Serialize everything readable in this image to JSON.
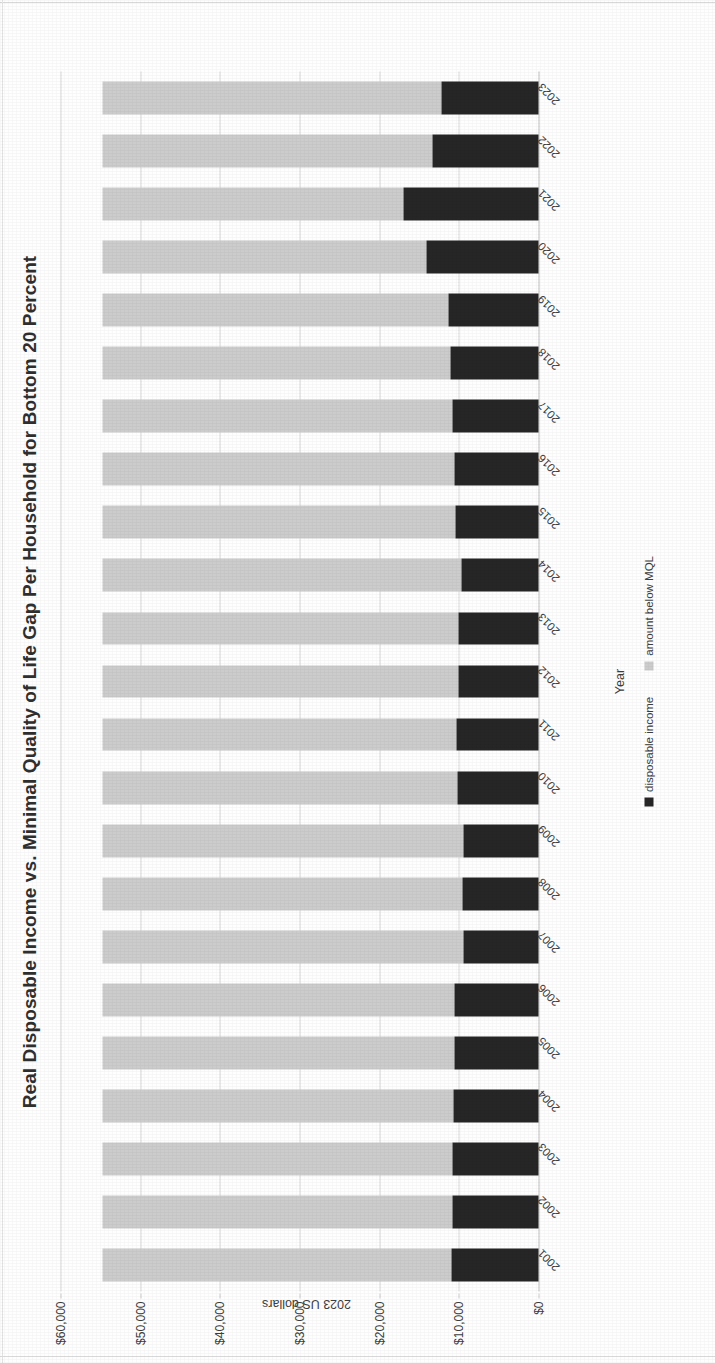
{
  "chart_data": {
    "type": "bar",
    "subtype": "stacked-horizontal-scan",
    "title": "Real Disposable Income vs. Minimal Quality of Life Gap Per Household for Bottom 20 Percent",
    "xlabel": "Year",
    "ylabel": "2023 US dollars",
    "ylim": [
      0,
      60000
    ],
    "ytick_labels": [
      "$60,000",
      "$50,000",
      "$40,000",
      "$30,000",
      "$20,000",
      "$10,000",
      "$0"
    ],
    "ytick_values": [
      60000,
      50000,
      40000,
      30000,
      20000,
      10000,
      0
    ],
    "grid": true,
    "legend_position": "bottom",
    "categories": [
      "2001",
      "2002",
      "2003",
      "2004",
      "2005",
      "2006",
      "2007",
      "2008",
      "2009",
      "2010",
      "2011",
      "2012",
      "2013",
      "2014",
      "2015",
      "2016",
      "2017",
      "2018",
      "2019",
      "2020",
      "2021",
      "2022",
      "2023"
    ],
    "series": [
      {
        "name": "disposable income",
        "color": "#262626",
        "values": [
          10900,
          10800,
          10800,
          10700,
          10600,
          10600,
          9400,
          9500,
          9400,
          10200,
          10300,
          10000,
          10100,
          9700,
          10400,
          10600,
          10800,
          11100,
          11300,
          14000,
          17000,
          13300,
          12200
        ]
      },
      {
        "name": "amount below MQL",
        "color": "#cccccc",
        "values": [
          43800,
          43900,
          43900,
          44000,
          44100,
          44100,
          45300,
          45200,
          45300,
          44500,
          44400,
          44700,
          44600,
          45000,
          44300,
          44100,
          43900,
          43600,
          43400,
          40700,
          37700,
          41400,
          42500
        ]
      }
    ],
    "totals": [
      54700,
      54700,
      54700,
      54700,
      54700,
      54700,
      54700,
      54700,
      54700,
      54700,
      54700,
      54700,
      54700,
      54700,
      54700,
      54700,
      54700,
      54700,
      54700,
      54700,
      54700,
      54700,
      54700
    ]
  }
}
